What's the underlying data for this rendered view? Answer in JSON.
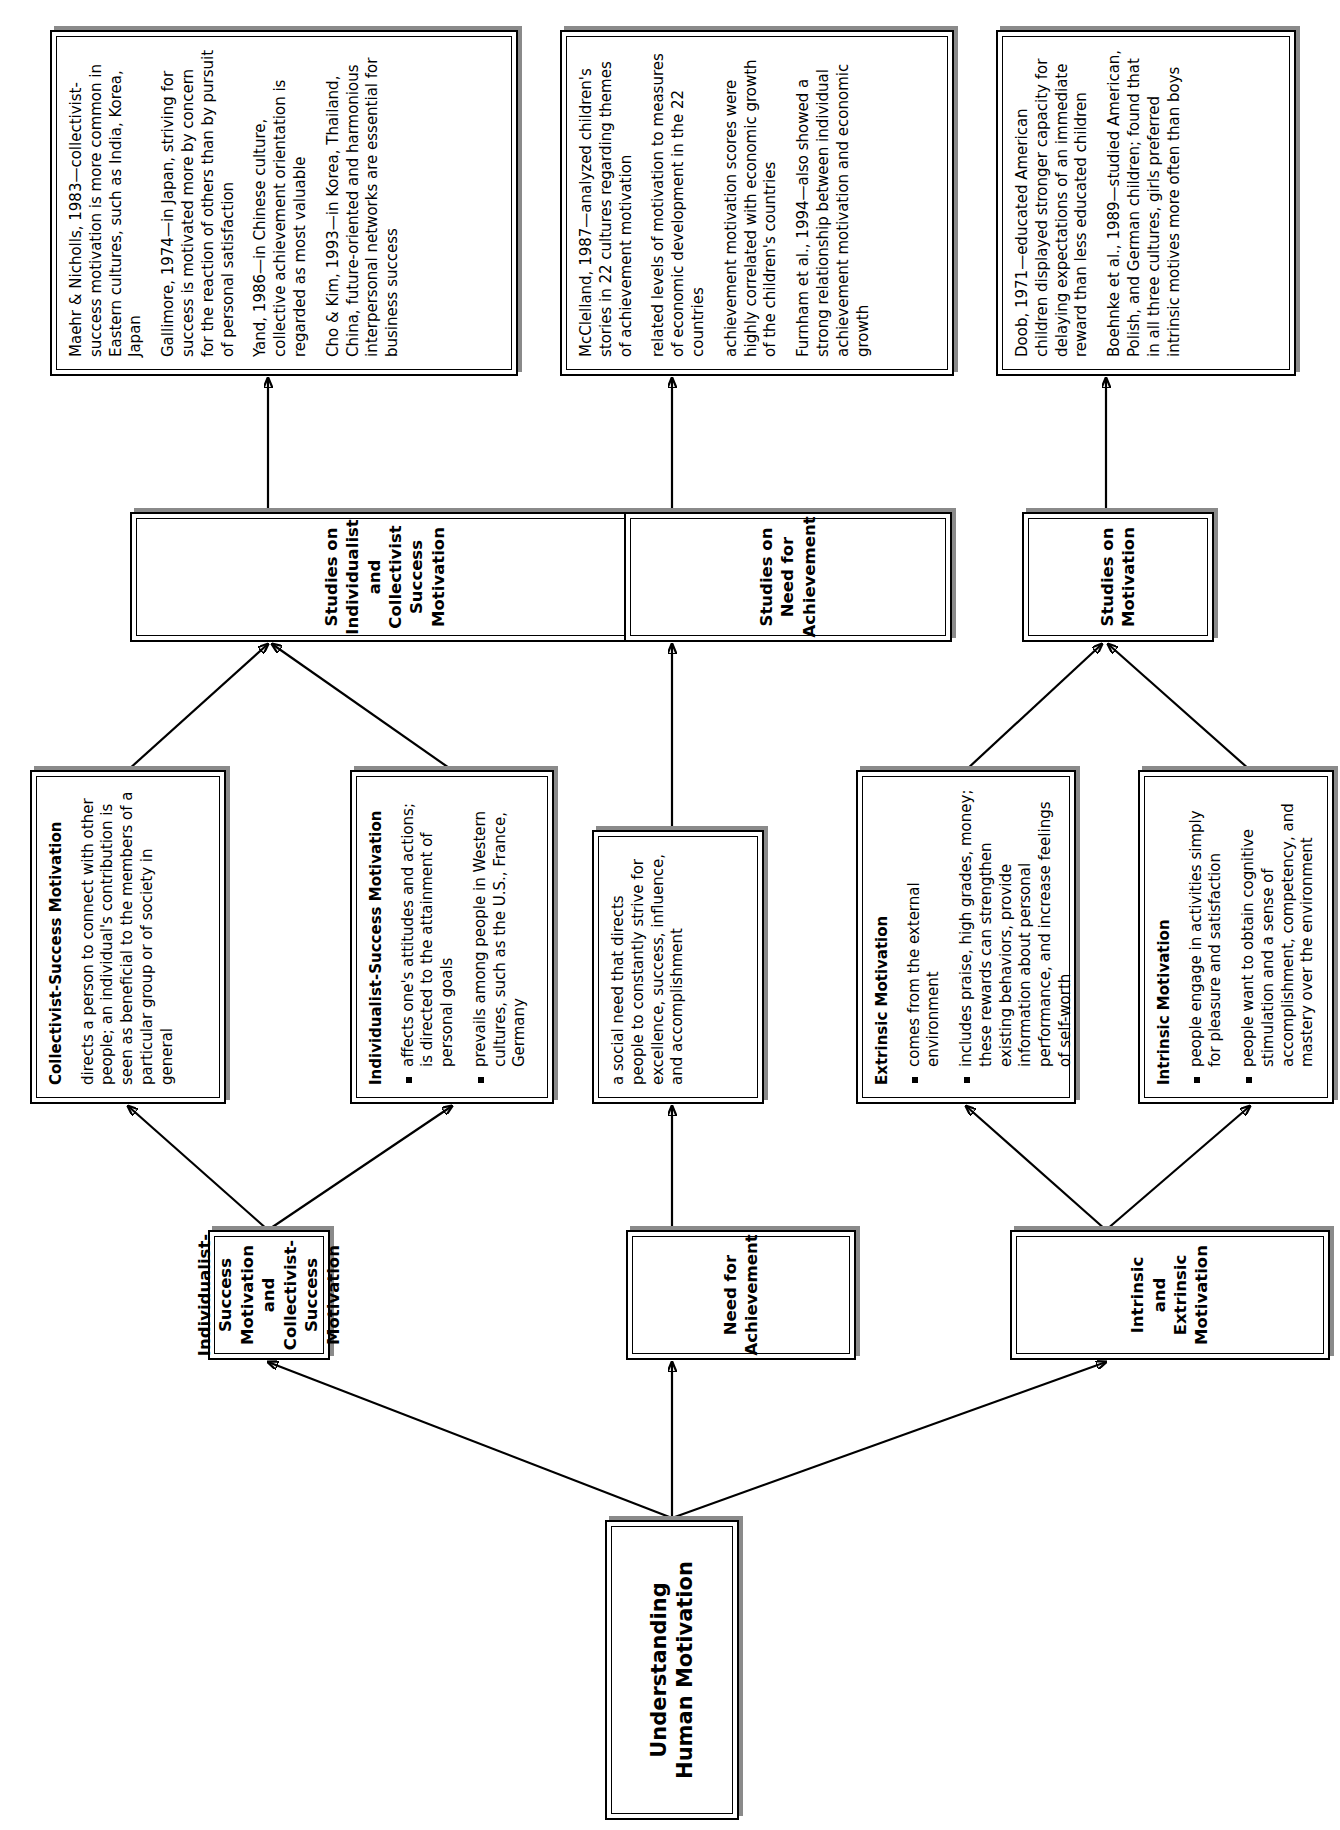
{
  "diagram": {
    "title": "Understanding Human Motivation",
    "root": {
      "label": "Understanding Human Motivation"
    },
    "branches": {
      "intrinsic_extrinsic": {
        "label": "Intrinsic and Extrinsic Motivation",
        "children": [
          {
            "heading": "Intrinsic Motivation",
            "bullets": [
              "people engage in activities simply for pleasure and satisfaction",
              "people want to obtain cognitive stimulation and a sense of accomplishment, competency, and mastery over the environment"
            ]
          },
          {
            "heading": "Extrinsic Motivation",
            "bullets": [
              "comes from the external environment",
              "includes praise, high grades, money; these rewards can strengthen existing behaviors, provide information about personal performance, and increase feelings of self-worth"
            ]
          }
        ],
        "studies_label": "Studies on Motivation",
        "studies": [
          "Doob, 1971—educated American children displayed stronger capacity for delaying expectations of an immediate reward than less educated children",
          "Boehnke et al., 1989—studied American, Polish, and German children; found that in all three cultures, girls preferred intrinsic motives more often than boys"
        ]
      },
      "need_achievement": {
        "label": "Need for Achievement",
        "children": [
          {
            "heading": "",
            "paragraphs": [
              "a social need that directs people to constantly strive for excellence, success, influence, and accomplishment"
            ]
          }
        ],
        "studies_label": "Studies on Need for Achievement",
        "studies": [
          "McClelland, 1987—analyzed children's stories in 22 cultures regarding themes of achievement motivation",
          "related levels of motivation to measures of economic development in the 22 countries",
          "achievement motivation scores were highly correlated with economic growth of the children's countries",
          "Furnham et al., 1994—also showed a strong relationship between individual achievement motivation and economic growth"
        ]
      },
      "success_motivation": {
        "label": "Individualist-Success Motivation and Collectivist-Success Motivation",
        "label_lines": [
          "Individualist-Success Motivation",
          "and",
          "Collectivist-Success Motivation"
        ],
        "children": [
          {
            "heading": "Individualist-Success Motivation",
            "bullets": [
              "affects one's attitudes and actions; is directed to the attainment of personal goals",
              "prevails among people in Western cultures, such as the U.S., France, Germany"
            ]
          },
          {
            "heading": "Collectivist-Success Motivation",
            "paragraphs": [
              "directs a person to connect with other people; an individual's contribution is seen as beneficial to the members of a particular group or of society in general"
            ]
          }
        ],
        "studies_label": "Studies on Individualist and Collectivist Success Motivation",
        "studies": [
          "Maehr & Nicholls, 1983—collectivist-success motivation is more common in Eastern cultures, such as India, Korea, Japan",
          "Gallimore, 1974—in Japan, striving for success is motivated more by concern for the reaction of others than by pursuit of personal satisfaction",
          "Yand, 1986—in Chinese culture, collective achievement orientation is regarded as most valuable",
          "Cho & Kim, 1993—in Korea, Thailand, China, future-oriented and harmonious interpersonal networks are essential for business success"
        ]
      }
    },
    "colors": {
      "box_border": "#000000",
      "box_shadow": "#8a8a8a",
      "background": "#ffffff",
      "text": "#000000"
    }
  }
}
